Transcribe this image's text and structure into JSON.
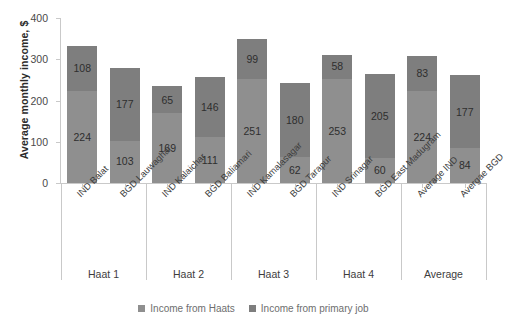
{
  "chart_data": {
    "type": "bar",
    "subtype": "stacked-vertical",
    "title": "",
    "xlabel": "",
    "ylabel": "Average monthly income, $",
    "ylim": [
      0,
      400
    ],
    "yticks": [
      0,
      100,
      200,
      300,
      400
    ],
    "grid": false,
    "legend_position": "bottom-center",
    "categories": [
      "IND Balat",
      "BGD Lauwaghar",
      "IND Kalaichar",
      "BGD Baliamari",
      "IND Kamalasagar",
      "BGD Tarapur",
      "IND Srinagar",
      "BGD East Madugram",
      "Average IND",
      "Avergae BGD"
    ],
    "groups": [
      {
        "label": "Haat 1",
        "categories": [
          "IND Balat",
          "BGD Lauwaghar"
        ]
      },
      {
        "label": "Haat 2",
        "categories": [
          "IND Kalaichar",
          "BGD Baliamari"
        ]
      },
      {
        "label": "Haat 3",
        "categories": [
          "IND Kamalasagar",
          "BGD Tarapur"
        ]
      },
      {
        "label": "Haat 4",
        "categories": [
          "IND Srinagar",
          "BGD East Madugram"
        ]
      },
      {
        "label": "Average",
        "categories": [
          "Average IND",
          "Avergae BGD"
        ]
      }
    ],
    "series": [
      {
        "name": "Income from Haats",
        "color": "#8f8f8f",
        "stack_position": "bottom",
        "values": [
          224,
          103,
          169,
          111,
          251,
          62,
          253,
          60,
          224,
          84
        ]
      },
      {
        "name": "Income from primary job",
        "color": "#7e7e7e",
        "stack_position": "top",
        "values": [
          108,
          177,
          65,
          146,
          99,
          180,
          58,
          205,
          83,
          177
        ]
      }
    ],
    "totals": [
      332,
      280,
      234,
      257,
      350,
      242,
      311,
      265,
      307,
      261
    ]
  },
  "legend": {
    "items": [
      {
        "label": "Income from Haats",
        "color": "#8f8f8f"
      },
      {
        "label": "Income from primary job",
        "color": "#7e7e7e"
      }
    ]
  },
  "colors": {
    "series_haats": "#8f8f8f",
    "series_primary": "#7e7e7e",
    "axis": "#c9c9c9",
    "text": "#3d3d3d",
    "background": "#ffffff"
  }
}
